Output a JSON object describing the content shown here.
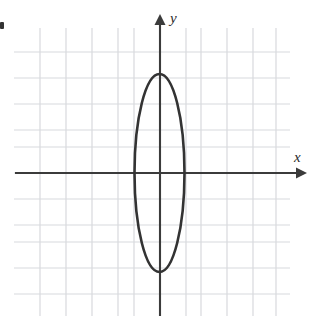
{
  "figure": {
    "kind": "coordinate-plane-with-conic",
    "width": 313,
    "height": 321,
    "background_color": "#ffffff"
  },
  "axes": {
    "x_label": "x",
    "y_label": "y",
    "axis_color": "#3b3b3b",
    "x_axis_y_px": 173,
    "y_axis_x_px": 160,
    "x_axis_start_px": 15,
    "x_axis_end_px": 307,
    "y_axis_start_px": 14,
    "y_axis_end_px": 316,
    "arrow_heads": [
      "x-positive",
      "y-positive"
    ]
  },
  "grid": {
    "color": "#d8d9dd",
    "spacing_px": 26,
    "left_px": 14,
    "right_px": 290,
    "top_px": 28,
    "bottom_px": 316,
    "vertical_lines_px": [
      40,
      66,
      92,
      118,
      134,
      160,
      186,
      201,
      227,
      253,
      276
    ],
    "horizontal_lines_px": [
      52,
      78,
      104,
      130,
      147,
      173,
      199,
      225,
      242,
      268,
      294
    ]
  },
  "chart_data": {
    "type": "scatter",
    "title": "",
    "xlabel": "x",
    "ylabel": "y",
    "grid": true,
    "legend": false,
    "curve": {
      "name": "ellipse",
      "shape": "ellipse",
      "center_px": [
        159.5,
        173
      ],
      "semi_axis_x_px": 25,
      "semi_axis_y_px": 99,
      "center_units": [
        0,
        0
      ],
      "semi_axis_x_units": 1,
      "semi_axis_y_units": 3.8,
      "stroke_color": "#333333",
      "stroke_width_px": 2.6,
      "orientation": "vertical-major-axis"
    }
  },
  "marks": {
    "corner_mark": "small-dark-tick-left-edge"
  }
}
